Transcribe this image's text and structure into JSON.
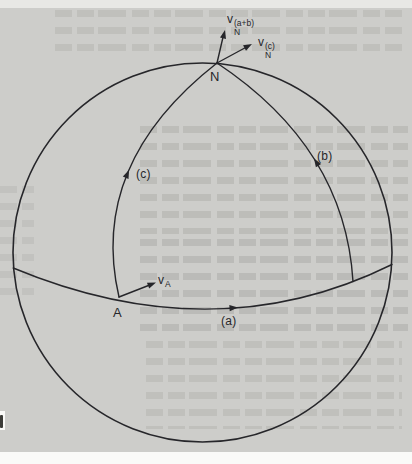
{
  "figure": {
    "labels": {
      "north_pole": "N",
      "point_a": "A",
      "path_a": "(a)",
      "path_b": "(b)",
      "path_c": "(c)"
    },
    "vectors": {
      "v_a": {
        "base": "v",
        "sub": "A"
      },
      "v_n_ab": {
        "base": "v",
        "sub": "N",
        "sup": "(a+b)"
      },
      "v_n_c": {
        "base": "v",
        "sub": "N",
        "sup": "(c)"
      }
    }
  },
  "colors": {
    "paper": "#cdcdca",
    "ink": "#26262a",
    "margin_top": "#e8e8e5",
    "margin_bottom": "#fafaf8",
    "smudge": "#3c3c38",
    "ghost": "#6e6e68"
  }
}
